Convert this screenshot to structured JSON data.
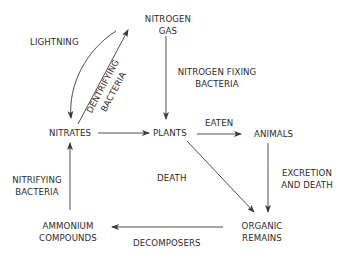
{
  "diagram": {
    "nodes": {
      "nitrogen_gas": {
        "line1": "NITROGEN",
        "line2": "GAS"
      },
      "nitrates": {
        "label": "NITRATES"
      },
      "plants": {
        "label": "PLANTS"
      },
      "animals": {
        "label": "ANIMALS"
      },
      "ammonium_compounds": {
        "line1": "AMMONIUM",
        "line2": "COMPOUNDS"
      },
      "organic_remains": {
        "line1": "ORGANIC",
        "line2": "REMAINS"
      }
    },
    "edges": {
      "lightning": {
        "label": "LIGHTNING",
        "from": "NITROGEN GAS",
        "to": "NITRATES"
      },
      "denitrifying_bacteria": {
        "line1": "DENTRIFYING",
        "line2": "BACTERIA",
        "from": "NITRATES",
        "to": "NITROGEN GAS"
      },
      "nitrogen_fixing_bacteria": {
        "line1": "NITROGEN FIXING",
        "line2": "BACTERIA",
        "from": "NITROGEN GAS",
        "to": "PLANTS"
      },
      "nitrates_to_plants": {
        "from": "NITRATES",
        "to": "PLANTS"
      },
      "eaten": {
        "label": "EATEN",
        "from": "PLANTS",
        "to": "ANIMALS"
      },
      "death": {
        "label": "DEATH",
        "from": "PLANTS",
        "to": "ORGANIC REMAINS"
      },
      "excretion_and_death": {
        "line1": "EXCRETION",
        "line2": "AND DEATH",
        "from": "ANIMALS",
        "to": "ORGANIC REMAINS"
      },
      "decomposers": {
        "label": "DECOMPOSERS",
        "from": "ORGANIC REMAINS",
        "to": "AMMONIUM COMPOUNDS"
      },
      "nitrifying_bacteria": {
        "line1": "NITRIFYING",
        "line2": "BACTERIA",
        "from": "AMMONIUM COMPOUNDS",
        "to": "NITRATES"
      }
    },
    "colors": {
      "line": "#3a3a3a",
      "text": "#2b2b2b",
      "background": "#ffffff"
    }
  }
}
